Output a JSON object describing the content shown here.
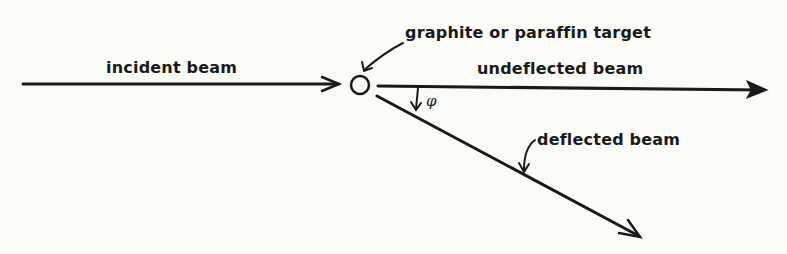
{
  "diagram": {
    "labels": {
      "incident_beam": "incident beam",
      "target": "graphite or paraffin target",
      "undeflected_beam": "undeflected beam",
      "deflected_beam": "deflected beam",
      "angle_symbol": "φ"
    },
    "colors": {
      "ink": "#1a1a1a",
      "paper": "#fbfbf8"
    }
  }
}
